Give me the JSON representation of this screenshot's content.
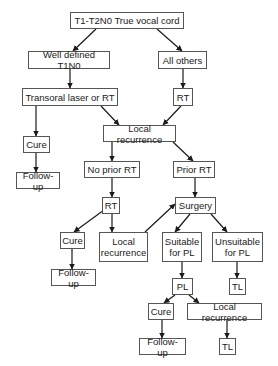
{
  "diagram": {
    "type": "flowchart",
    "colors": {
      "border": "#555555",
      "text": "#1a1a1a",
      "arrow": "#1a1a1a",
      "background": "#ffffff"
    },
    "nodes": [
      {
        "id": "root",
        "label": "T1-T2N0 True vocal cord",
        "x": 70,
        "y": 12,
        "w": 114,
        "h": 17
      },
      {
        "id": "well_defined",
        "label": "Well defined T1N0",
        "x": 28,
        "y": 51,
        "w": 82,
        "h": 18
      },
      {
        "id": "all_others",
        "label": "All others",
        "x": 158,
        "y": 51,
        "w": 49,
        "h": 18
      },
      {
        "id": "transoral",
        "label": "Transoral laser or RT",
        "x": 22,
        "y": 88,
        "w": 96,
        "h": 18
      },
      {
        "id": "rt1",
        "label": "RT",
        "x": 173,
        "y": 88,
        "w": 20,
        "h": 18
      },
      {
        "id": "cure1",
        "label": "Cure",
        "x": 23,
        "y": 136,
        "w": 27,
        "h": 17
      },
      {
        "id": "local_rec1",
        "label": "Local recurrence",
        "x": 103,
        "y": 125,
        "w": 73,
        "h": 17
      },
      {
        "id": "followup1",
        "label": "Follow-up",
        "x": 16,
        "y": 172,
        "w": 44,
        "h": 17
      },
      {
        "id": "no_prior_rt",
        "label": "No prior RT",
        "x": 84,
        "y": 161,
        "w": 56,
        "h": 17
      },
      {
        "id": "prior_rt",
        "label": "Prior RT",
        "x": 173,
        "y": 161,
        "w": 42,
        "h": 17
      },
      {
        "id": "rt2",
        "label": "RT",
        "x": 102,
        "y": 197,
        "w": 18,
        "h": 17
      },
      {
        "id": "surgery",
        "label": "Surgery",
        "x": 175,
        "y": 197,
        "w": 41,
        "h": 17
      },
      {
        "id": "cure2",
        "label": "Cure",
        "x": 60,
        "y": 232,
        "w": 25,
        "h": 17
      },
      {
        "id": "local_rec2",
        "label": "Local\nrecurrence",
        "x": 99,
        "y": 232,
        "w": 49,
        "h": 30
      },
      {
        "id": "suitable_pl",
        "label": "Suitable\nfor PL",
        "x": 162,
        "y": 232,
        "w": 40,
        "h": 30
      },
      {
        "id": "unsuitable_pl",
        "label": "Unsuitable\nfor PL",
        "x": 212,
        "y": 232,
        "w": 51,
        "h": 30
      },
      {
        "id": "followup2",
        "label": "Follow-up",
        "x": 51,
        "y": 269,
        "w": 45,
        "h": 17
      },
      {
        "id": "pl",
        "label": "PL",
        "x": 172,
        "y": 278,
        "w": 21,
        "h": 17
      },
      {
        "id": "tl1",
        "label": "TL",
        "x": 229,
        "y": 278,
        "w": 17,
        "h": 17
      },
      {
        "id": "cure3",
        "label": "Cure",
        "x": 148,
        "y": 303,
        "w": 26,
        "h": 17
      },
      {
        "id": "local_rec3",
        "label": "Local recurrence",
        "x": 187,
        "y": 303,
        "w": 75,
        "h": 17
      },
      {
        "id": "followup3",
        "label": "Follow-up",
        "x": 139,
        "y": 338,
        "w": 47,
        "h": 17
      },
      {
        "id": "tl2",
        "label": "TL",
        "x": 219,
        "y": 338,
        "w": 17,
        "h": 17
      }
    ],
    "edges": [
      {
        "from": "root",
        "to": "well_defined",
        "x1": 96,
        "y1": 29,
        "x2": 73,
        "y2": 51
      },
      {
        "from": "root",
        "to": "all_others",
        "x1": 157,
        "y1": 29,
        "x2": 182,
        "y2": 51
      },
      {
        "from": "well_defined",
        "to": "transoral",
        "x1": 70,
        "y1": 69,
        "x2": 70,
        "y2": 88
      },
      {
        "from": "all_others",
        "to": "rt1",
        "x1": 183,
        "y1": 69,
        "x2": 183,
        "y2": 88
      },
      {
        "from": "transoral",
        "to": "cure1",
        "x1": 36,
        "y1": 106,
        "x2": 36,
        "y2": 136
      },
      {
        "from": "transoral",
        "to": "local_rec1",
        "x1": 101,
        "y1": 106,
        "x2": 119,
        "y2": 125
      },
      {
        "from": "rt1",
        "to": "local_rec1",
        "x1": 181,
        "y1": 106,
        "x2": 163,
        "y2": 125
      },
      {
        "from": "cure1",
        "to": "followup1",
        "x1": 36,
        "y1": 153,
        "x2": 36,
        "y2": 172
      },
      {
        "from": "local_rec1",
        "to": "no_prior_rt",
        "x1": 112,
        "y1": 142,
        "x2": 112,
        "y2": 161
      },
      {
        "from": "local_rec1",
        "to": "prior_rt",
        "x1": 173,
        "y1": 142,
        "x2": 193,
        "y2": 161
      },
      {
        "from": "no_prior_rt",
        "to": "rt2",
        "x1": 112,
        "y1": 178,
        "x2": 112,
        "y2": 197
      },
      {
        "from": "prior_rt",
        "to": "surgery",
        "x1": 195,
        "y1": 178,
        "x2": 195,
        "y2": 197
      },
      {
        "from": "rt2",
        "to": "cure2",
        "x1": 104,
        "y1": 210,
        "x2": 74,
        "y2": 232
      },
      {
        "from": "rt2",
        "to": "local_rec2",
        "x1": 112,
        "y1": 214,
        "x2": 112,
        "y2": 232
      },
      {
        "from": "local_rec2",
        "to": "surgery",
        "x1": 145,
        "y1": 232,
        "x2": 175,
        "y2": 204
      },
      {
        "from": "surgery",
        "to": "suitable_pl",
        "x1": 190,
        "y1": 214,
        "x2": 175,
        "y2": 232
      },
      {
        "from": "surgery",
        "to": "unsuitable_pl",
        "x1": 211,
        "y1": 214,
        "x2": 227,
        "y2": 232
      },
      {
        "from": "cure2",
        "to": "followup2",
        "x1": 72,
        "y1": 249,
        "x2": 72,
        "y2": 269
      },
      {
        "from": "suitable_pl",
        "to": "pl",
        "x1": 182,
        "y1": 262,
        "x2": 182,
        "y2": 278
      },
      {
        "from": "unsuitable_pl",
        "to": "tl1",
        "x1": 237,
        "y1": 262,
        "x2": 237,
        "y2": 278
      },
      {
        "from": "pl",
        "to": "cure3",
        "x1": 175,
        "y1": 295,
        "x2": 164,
        "y2": 303
      },
      {
        "from": "pl",
        "to": "local_rec3",
        "x1": 189,
        "y1": 295,
        "x2": 199,
        "y2": 303
      },
      {
        "from": "cure3",
        "to": "followup3",
        "x1": 162,
        "y1": 320,
        "x2": 162,
        "y2": 338
      },
      {
        "from": "local_rec3",
        "to": "tl2",
        "x1": 227,
        "y1": 320,
        "x2": 227,
        "y2": 338
      }
    ]
  }
}
